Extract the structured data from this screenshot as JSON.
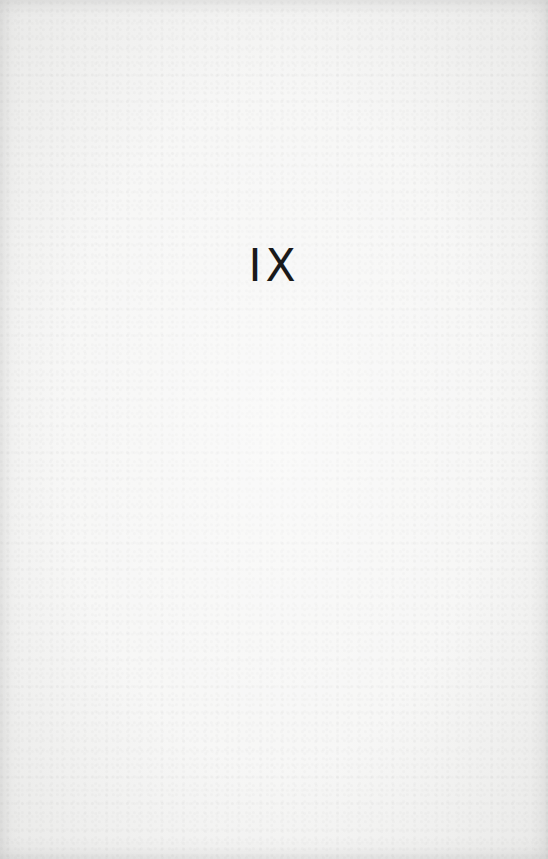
{
  "page": {
    "chapter_number": "IX",
    "background_color": "#f4f4f3",
    "text_color": "#1a1a1a"
  }
}
